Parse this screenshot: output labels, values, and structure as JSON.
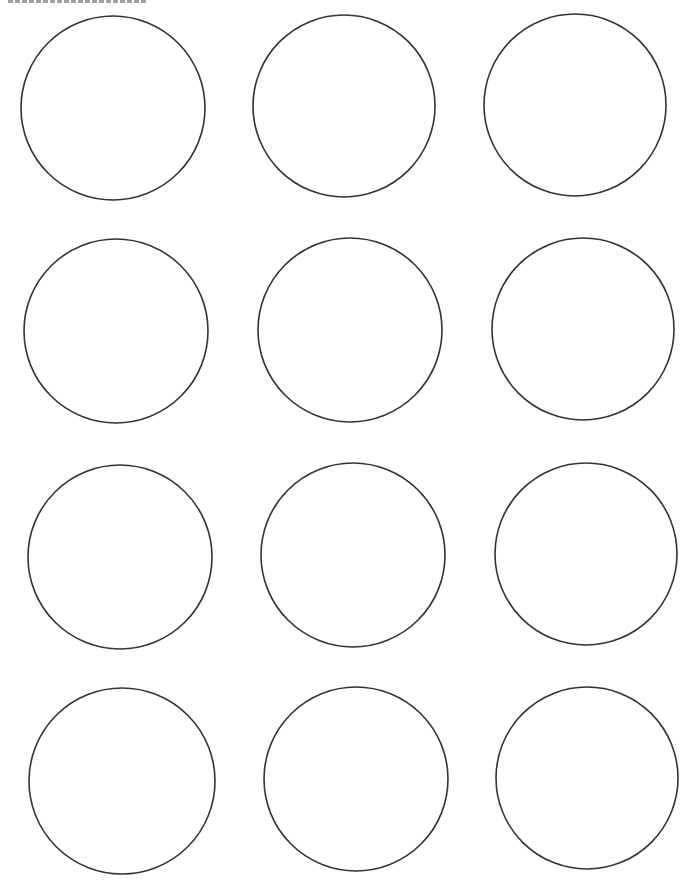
{
  "page": {
    "type": "printable circle template",
    "background": "#ffffff",
    "stroke_color": "#333333",
    "layout": {
      "rows": 4,
      "columns": 3
    }
  },
  "circles": [
    {
      "cx": 113,
      "cy": 108,
      "r": 92
    },
    {
      "cx": 344,
      "cy": 106,
      "r": 91
    },
    {
      "cx": 575,
      "cy": 105,
      "r": 91
    },
    {
      "cx": 116,
      "cy": 331,
      "r": 92
    },
    {
      "cx": 350,
      "cy": 330,
      "r": 92
    },
    {
      "cx": 583,
      "cy": 329,
      "r": 91
    },
    {
      "cx": 120,
      "cy": 557,
      "r": 92
    },
    {
      "cx": 353,
      "cy": 555,
      "r": 92
    },
    {
      "cx": 586,
      "cy": 554,
      "r": 91
    },
    {
      "cx": 122,
      "cy": 781,
      "r": 93
    },
    {
      "cx": 356,
      "cy": 779,
      "r": 92
    },
    {
      "cx": 587,
      "cy": 778,
      "r": 91
    }
  ]
}
